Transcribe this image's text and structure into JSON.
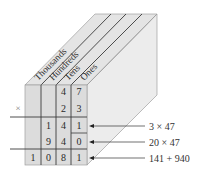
{
  "diagram": {
    "columns": [
      "Thousands",
      "Hundreds",
      "Tens",
      "Ones"
    ],
    "times_sign": "×",
    "rows": [
      {
        "name": "multiplicand",
        "digits": [
          "",
          "",
          "4",
          "7"
        ]
      },
      {
        "name": "multiplier",
        "digits": [
          "",
          "",
          "2",
          "3"
        ]
      },
      {
        "name": "partial-product-1",
        "digits": [
          "",
          "1",
          "4",
          "1"
        ],
        "annotation": "3 × 47"
      },
      {
        "name": "partial-product-2",
        "digits": [
          "",
          "9",
          "4",
          "0"
        ],
        "annotation": "20 × 47"
      },
      {
        "name": "product",
        "digits": [
          "1",
          "0",
          "8",
          "1"
        ],
        "annotation": "141 + 940"
      }
    ],
    "colors": {
      "front_face": "#dedede",
      "top_face": "#e6e6e6",
      "side_face": "#ececec",
      "lines": "#3a3a3a",
      "edges": "#9a9a9a"
    }
  }
}
